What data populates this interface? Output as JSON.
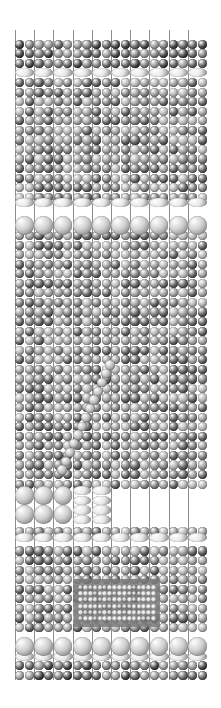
{
  "figure": {
    "domain": "crystal-lattice-visualization",
    "render_style": "space-filling-ball-and-stick",
    "colorspace": "grayscale",
    "background": "#ffffff",
    "canvas": {
      "width": 221,
      "height": 708
    }
  },
  "lattice": {
    "origin": {
      "x": 15,
      "y": 30
    },
    "extent": {
      "width": 192,
      "height": 650
    },
    "columns": 20,
    "rows": 68,
    "col_spacing": 9.6,
    "row_spacing": 9.56,
    "supercell_columns": 10,
    "supercell_col_spacing": 19.2,
    "base_atom_radius": 4.6,
    "bond_color": "#8e8e8e",
    "bond_width": 1
  },
  "palette": {
    "bulk_dark": "#6e6e6e",
    "bulk_mid": "#8a8a8a",
    "bulk_light": "#a6a6a6",
    "bulk_pale": "#bdbdbd",
    "interface_bright": "#e8e8e8",
    "large_sphere": "#cfcfcf",
    "inclusion": "#e0e0e0",
    "dislocation": "#c4c4c4",
    "outline": "#4a4a4a",
    "highlight": "#ffffff",
    "accent_region": "#7a7a7a"
  },
  "layers": [
    {
      "name": "top-bond-fringe",
      "y": 30,
      "height": 10,
      "kind": "bonds-only",
      "label": "top surface bonds"
    },
    {
      "name": "top-bulk-slab",
      "y": 40,
      "height": 28,
      "kind": "bulk",
      "tone": "bulk_dark",
      "label": "upper dark slab"
    },
    {
      "name": "interface-layer-1",
      "y": 68,
      "height": 9,
      "kind": "flat-ellipse-row",
      "tone": "interface_bright",
      "label": "bright interface layer 1"
    },
    {
      "name": "mid-bulk-slab-1",
      "y": 77,
      "height": 110,
      "kind": "bulk",
      "tone": "bulk_mid",
      "label": "mid bulk slab A"
    },
    {
      "name": "interface-layer-2",
      "y": 198,
      "height": 9,
      "kind": "flat-ellipse-row",
      "tone": "interface_bright",
      "label": "bright interface layer 2"
    },
    {
      "name": "large-sphere-row-1",
      "y": 216,
      "height": 19,
      "kind": "large-sphere-row",
      "tone": "large_sphere",
      "label": "large cation row 1"
    },
    {
      "name": "mid-bulk-slab-2",
      "y": 236,
      "height": 250,
      "kind": "bulk",
      "tone": "bulk_mid",
      "label": "mid bulk slab B"
    },
    {
      "name": "large-sphere-row-2",
      "y": 486,
      "height": 38,
      "kind": "large-sphere-block",
      "tone": "large_sphere",
      "label": "large cation block"
    },
    {
      "name": "interface-layer-3",
      "y": 533,
      "height": 9,
      "kind": "flat-ellipse-row",
      "tone": "interface_bright",
      "label": "bright interface layer 3"
    },
    {
      "name": "lower-bulk-slab",
      "y": 552,
      "height": 84,
      "kind": "bulk",
      "tone": "bulk_mid",
      "label": "lower bulk slab"
    },
    {
      "name": "large-sphere-row-3",
      "y": 637,
      "height": 19,
      "kind": "large-sphere-row",
      "tone": "large_sphere",
      "label": "large cation row 2"
    },
    {
      "name": "interface-layer-4",
      "y": 652,
      "height": 9,
      "kind": "flat-ellipse-row",
      "tone": "interface_bright",
      "label": "bright interface layer 4"
    },
    {
      "name": "bottom-bulk-slab",
      "y": 660,
      "height": 20,
      "kind": "bulk",
      "tone": "bulk_dark",
      "label": "bottom dark slab"
    }
  ],
  "features": [
    {
      "name": "dislocation-streak",
      "type": "diagonal-defect",
      "label": "diagonal dislocation line",
      "tone": "dislocation",
      "start": {
        "x": 110,
        "y": 365
      },
      "end": {
        "x": 62,
        "y": 470
      },
      "atom_count": 13,
      "slope": -2.2
    },
    {
      "name": "bright-inclusion",
      "type": "rectangular-inclusion",
      "label": "embedded bright nano-inclusion",
      "tone": "inclusion",
      "frame_tone": "accent_region",
      "x": 78,
      "y": 584,
      "width": 78,
      "height": 38,
      "columns": 16,
      "rows": 6,
      "atom_radius": 2.4
    },
    {
      "name": "ellipsoid-cluster",
      "type": "flattened-ellipsoid-patch",
      "label": "flattened ellipsoid cluster",
      "tone": "interface_bright",
      "x": 86,
      "y": 486,
      "width": 38,
      "height": 38,
      "columns": 2,
      "rows": 4
    }
  ],
  "chart_data": {
    "type": "heatmap",
    "title": "",
    "xlabel": "",
    "ylabel": "",
    "grid": false,
    "legend": "none",
    "columns": 20,
    "rows": 68,
    "xlim": [
      0,
      20
    ],
    "ylim": [
      0,
      68
    ],
    "value_range": [
      0.28,
      0.95
    ],
    "row_profile": [
      0.36,
      0.36,
      0.36,
      0.4,
      0.92,
      0.48,
      0.5,
      0.52,
      0.54,
      0.52,
      0.5,
      0.52,
      0.54,
      0.56,
      0.54,
      0.52,
      0.5,
      0.52,
      0.93,
      0.46,
      0.84,
      0.84,
      0.5,
      0.52,
      0.54,
      0.52,
      0.5,
      0.48,
      0.5,
      0.52,
      0.54,
      0.56,
      0.54,
      0.52,
      0.5,
      0.52,
      0.54,
      0.56,
      0.58,
      0.56,
      0.54,
      0.52,
      0.5,
      0.52,
      0.54,
      0.56,
      0.54,
      0.52,
      0.5,
      0.48,
      0.82,
      0.82,
      0.8,
      0.92,
      0.44,
      0.48,
      0.5,
      0.52,
      0.54,
      0.56,
      0.58,
      0.6,
      0.84,
      0.84,
      0.93,
      0.4,
      0.38,
      0.36
    ]
  }
}
